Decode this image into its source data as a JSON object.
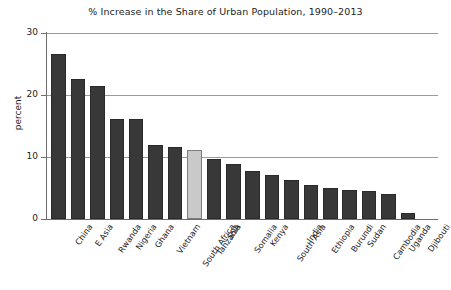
{
  "chart_data": {
    "type": "bar",
    "title": "% Increase in the Share of Urban Population, 1990–2013",
    "xlabel": "",
    "ylabel": "percent",
    "ylim": [
      0,
      30
    ],
    "yticks": [
      "0",
      "10",
      "20",
      "30"
    ],
    "ytick_values": [
      0,
      10,
      20,
      30
    ],
    "grid": "horizontal",
    "legend": "none",
    "categories": [
      "China",
      "E Asia",
      "Rwanda",
      "Nigeria",
      "Ghana",
      "Vietnam",
      "South Africa",
      "Tanzania",
      "SSA",
      "Somalia",
      "Kenya",
      "South Asia",
      "India",
      "Ethiopia",
      "Burundi",
      "Sudan",
      "Cambodia",
      "Uganda",
      "Djibouti"
    ],
    "values": [
      26.6,
      22.6,
      21.4,
      16.2,
      16.2,
      11.9,
      11.6,
      11.2,
      9.6,
      8.8,
      7.8,
      7.1,
      6.3,
      5.5,
      5.0,
      4.6,
      4.5,
      4.1,
      0.9
    ],
    "highlight_category": "Tanzania",
    "colors": {
      "bar": "#383838",
      "bar_highlight": "#c9c9c9",
      "gridline": "#9a9a9a",
      "axis": "#6d6d6d",
      "text": "#1c1c1c",
      "background": "#ffffff"
    }
  }
}
